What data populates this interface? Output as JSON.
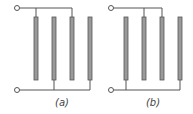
{
  "diagrams": [
    {
      "id": "a",
      "label": "(a)",
      "label_pos": {
        "x": 62,
        "y": 97
      },
      "terminal_top": {
        "x": 17,
        "y": 8
      },
      "terminal_bottom": {
        "x": 17,
        "y": 90
      },
      "plates_x": [
        36,
        54,
        72,
        90
      ],
      "top_connected": [
        0,
        2
      ],
      "bottom_connected": [
        1,
        3
      ]
    },
    {
      "id": "b",
      "label": "(b)",
      "label_pos": {
        "x": 153,
        "y": 97
      },
      "terminal_top": {
        "x": 111,
        "y": 8
      },
      "terminal_bottom": {
        "x": 111,
        "y": 90
      },
      "plates_x": [
        126,
        144,
        162,
        180
      ],
      "top_connected": [
        1,
        2
      ],
      "bottom_connected": [
        0,
        3
      ]
    }
  ],
  "plate": {
    "top": 17,
    "bottom": 80,
    "width": 4
  },
  "colors": {
    "wire": "#555555",
    "plate_fill": "#9a9a9a",
    "plate_edge": "#555555"
  }
}
